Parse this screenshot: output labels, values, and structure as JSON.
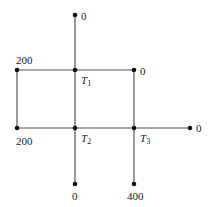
{
  "diagram": {
    "line_color": "#555555",
    "node_color": "#111111",
    "nodes": {
      "top": {
        "x": 75,
        "y": 15,
        "label": "0"
      },
      "t1_right": {
        "x": 134,
        "y": 70,
        "label": "0"
      },
      "t1_left": {
        "x": 17,
        "y": 70,
        "label": "200"
      },
      "t2_left": {
        "x": 17,
        "y": 128,
        "label": "200"
      },
      "t3_right": {
        "x": 190,
        "y": 128,
        "label": "0"
      },
      "t2_bottom": {
        "x": 75,
        "y": 184,
        "label": "0"
      },
      "t3_bottom": {
        "x": 134,
        "y": 184,
        "label": "400"
      }
    },
    "unknowns": {
      "t1": {
        "x": 75,
        "y": 70,
        "symbol": "T",
        "subscript": "1"
      },
      "t2": {
        "x": 75,
        "y": 128,
        "symbol": "T",
        "subscript": "2"
      },
      "t3": {
        "x": 134,
        "y": 128,
        "symbol": "T",
        "subscript": "3"
      }
    }
  }
}
